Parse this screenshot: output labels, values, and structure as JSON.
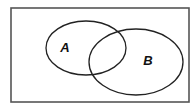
{
  "diagram": {
    "type": "venn",
    "universe": {
      "x": 11,
      "y": 8,
      "width": 178,
      "height": 94,
      "stroke": "#555555",
      "stroke_width": 1.6
    },
    "sets": [
      {
        "label": "A",
        "cx": 86,
        "cy": 48,
        "rx": 40,
        "ry": 27,
        "label_x": 65,
        "label_y": 52,
        "stroke": "#222222"
      },
      {
        "label": "B",
        "cx": 136,
        "cy": 62,
        "rx": 47,
        "ry": 33,
        "label_x": 148,
        "label_y": 65,
        "stroke": "#222222"
      }
    ]
  }
}
